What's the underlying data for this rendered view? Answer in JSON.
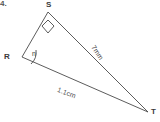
{
  "figure": {
    "corner_mark": "4.",
    "vertices": [
      {
        "name": "S",
        "label": "S",
        "x": 48,
        "y": 12
      },
      {
        "name": "R",
        "label": "R",
        "x": 22,
        "y": 57
      },
      {
        "name": "T",
        "label": "T",
        "x": 148,
        "y": 112
      }
    ],
    "angles": [
      {
        "at": "S",
        "label": "",
        "type": "right-angle-marker"
      },
      {
        "at": "R",
        "label": "n",
        "type": "arc"
      }
    ],
    "sides": [
      {
        "from": "S",
        "to": "T",
        "label": "7mm",
        "value": 7,
        "unit": "mm"
      },
      {
        "from": "R",
        "to": "T",
        "label": "1.1cm",
        "value": 1.1,
        "unit": "cm"
      },
      {
        "from": "R",
        "to": "S",
        "label": "",
        "value": null,
        "unit": ""
      }
    ],
    "colors": {
      "stroke": "#4a4a4a",
      "text": "#3a3a3a",
      "background": "#ffffff"
    }
  }
}
